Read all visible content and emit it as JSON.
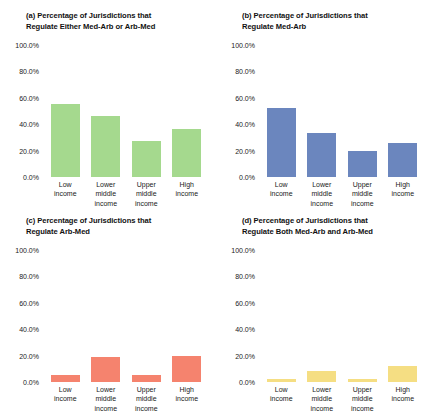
{
  "figure": {
    "categories": [
      "Low\nincome",
      "Lower\nmiddle\nincome",
      "Upper\nmiddle\nincome",
      "High\nincome"
    ],
    "yticks": [
      "0.0%",
      "20.0%",
      "40.0%",
      "60.0%",
      "80.0%",
      "100.0%"
    ],
    "colors": {
      "green": "#a5d98e",
      "blue": "#6b86be",
      "orange": "#f5836e",
      "yellow": "#f5de83"
    }
  },
  "panels": {
    "a": {
      "title": "(a) Percentage of Jurisdictions that\nRegulate Either Med-Arb or Arb-Med"
    },
    "b": {
      "title": "(b) Percentage of Jurisdictions that\nRegulate Med-Arb"
    },
    "c": {
      "title": "(c) Percentage of Jurisdictions that\nRegulate Arb-Med"
    },
    "d": {
      "title": "(d) Percentage of Jurisdictions that\nRegulate Both Med-Arb and Arb-Med"
    }
  },
  "chart_data": [
    {
      "type": "bar",
      "panel": "a",
      "title": "(a) Percentage of Jurisdictions that Regulate Either Med-Arb or Arb-Med",
      "categories": [
        "Low income",
        "Lower middle income",
        "Upper middle income",
        "High income"
      ],
      "values": [
        55.0,
        46.0,
        27.0,
        36.0
      ],
      "xlabel": "",
      "ylabel": "",
      "ylim": [
        0,
        100
      ],
      "yticks": [
        0,
        20,
        40,
        60,
        80,
        100
      ],
      "grid": false,
      "color": "#a5d98e"
    },
    {
      "type": "bar",
      "panel": "b",
      "title": "(b) Percentage of Jurisdictions that Regulate Med-Arb",
      "categories": [
        "Low income",
        "Lower middle income",
        "Upper middle income",
        "High income"
      ],
      "values": [
        52.0,
        33.0,
        20.0,
        26.0
      ],
      "xlabel": "",
      "ylabel": "",
      "ylim": [
        0,
        100
      ],
      "yticks": [
        0,
        20,
        40,
        60,
        80,
        100
      ],
      "grid": false,
      "color": "#6b86be"
    },
    {
      "type": "bar",
      "panel": "c",
      "title": "(c) Percentage of Jurisdictions that Regulate Arb-Med",
      "categories": [
        "Low income",
        "Lower middle income",
        "Upper middle income",
        "High income"
      ],
      "values": [
        5.0,
        19.0,
        5.0,
        20.0
      ],
      "xlabel": "",
      "ylabel": "",
      "ylim": [
        0,
        100
      ],
      "yticks": [
        0,
        20,
        40,
        60,
        80,
        100
      ],
      "grid": false,
      "color": "#f5836e"
    },
    {
      "type": "bar",
      "panel": "d",
      "title": "(d) Percentage of Jurisdictions that Regulate Both Med-Arb and Arb-Med",
      "categories": [
        "Low income",
        "Lower middle income",
        "Upper middle income",
        "High income"
      ],
      "values": [
        2.0,
        8.0,
        2.0,
        12.0
      ],
      "xlabel": "",
      "ylabel": "",
      "ylim": [
        0,
        100
      ],
      "yticks": [
        0,
        20,
        40,
        60,
        80,
        100
      ],
      "grid": false,
      "color": "#f5de83"
    }
  ]
}
